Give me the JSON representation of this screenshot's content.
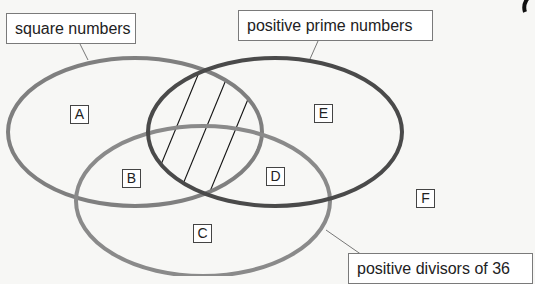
{
  "sets": [
    {
      "id": "square",
      "label": "square numbers",
      "color": "#7f7f7f"
    },
    {
      "id": "prime",
      "label": "positive prime numbers",
      "color": "#4a4a4a"
    },
    {
      "id": "divisors",
      "label": "positive divisors of 36",
      "color": "#8a8a8a"
    }
  ],
  "regions": {
    "A": "A",
    "B": "B",
    "C": "C",
    "D": "D",
    "E": "E",
    "F": "F"
  },
  "shaded_region": "square numbers ∩ positive prime numbers (hatched)"
}
